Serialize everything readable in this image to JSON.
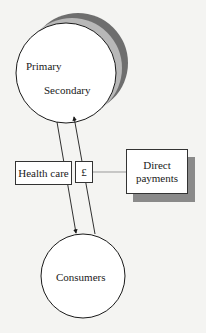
{
  "diagram": {
    "nodes": {
      "providers": {
        "primary_label": "Primary",
        "secondary_label": "Secondary"
      },
      "consumers": {
        "label": "Consumers"
      },
      "health_care": {
        "label": "Health care"
      },
      "currency": {
        "label": "£"
      },
      "direct_payments": {
        "label": "Direct\npayments",
        "line1": "Direct",
        "line2": "payments"
      }
    },
    "edges": [
      {
        "from": "providers",
        "to": "consumers",
        "meaning": "health care flow"
      },
      {
        "from": "consumers",
        "to": "providers",
        "meaning": "payment flow (£)"
      },
      {
        "from": "direct_payments",
        "to": "currency",
        "style": "line"
      }
    ],
    "colors": {
      "background": "#f4f4f2",
      "shadow_light": "#b8b8b8",
      "shadow_dark": "#6e6e6e",
      "stroke": "#1a1a1a"
    }
  }
}
